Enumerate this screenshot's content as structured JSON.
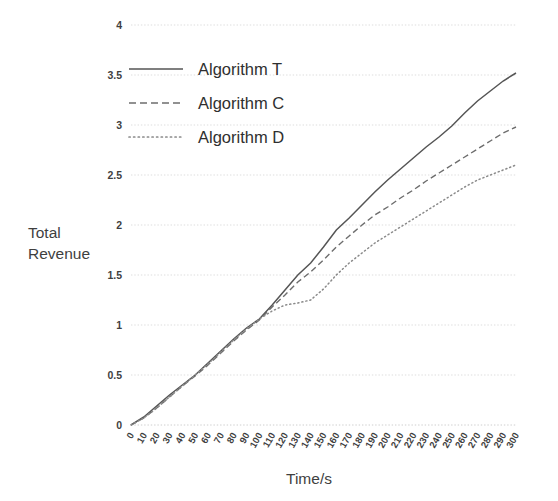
{
  "chart_data": {
    "type": "line",
    "title": "",
    "xlabel": "Time/s",
    "ylabel": "Total Revenue",
    "xlim": [
      0,
      300
    ],
    "ylim": [
      0,
      4
    ],
    "grid": true,
    "legend_position": "upper-left",
    "x": [
      0,
      10,
      20,
      30,
      40,
      50,
      60,
      70,
      80,
      90,
      100,
      110,
      120,
      130,
      140,
      150,
      160,
      170,
      180,
      190,
      200,
      210,
      220,
      230,
      240,
      250,
      260,
      270,
      280,
      290,
      300
    ],
    "xticks": [
      "0",
      "10",
      "20",
      "30",
      "40",
      "50",
      "60",
      "70",
      "80",
      "90",
      "100",
      "110",
      "120",
      "130",
      "140",
      "150",
      "160",
      "170",
      "180",
      "190",
      "200",
      "210",
      "220",
      "230",
      "240",
      "250",
      "260",
      "270",
      "280",
      "290",
      "300"
    ],
    "yticks": [
      "0",
      "0.5",
      "1",
      "1.5",
      "2",
      "2.5",
      "3",
      "3.5",
      "4"
    ],
    "ytick_values": [
      0,
      0.5,
      1,
      1.5,
      2,
      2.5,
      3,
      3.5,
      4
    ],
    "series": [
      {
        "name": "Algorithm T",
        "style": "solid",
        "color": "#555555",
        "values": [
          0.0,
          0.08,
          0.19,
          0.3,
          0.4,
          0.5,
          0.62,
          0.74,
          0.86,
          0.97,
          1.06,
          1.2,
          1.35,
          1.5,
          1.62,
          1.78,
          1.95,
          2.07,
          2.2,
          2.33,
          2.45,
          2.56,
          2.67,
          2.78,
          2.88,
          2.99,
          3.12,
          3.24,
          3.34,
          3.44,
          3.52
        ]
      },
      {
        "name": "Algorithm C",
        "style": "dashed",
        "color": "#6d6d6d",
        "values": [
          0.0,
          0.07,
          0.17,
          0.28,
          0.39,
          0.49,
          0.6,
          0.72,
          0.84,
          0.95,
          1.05,
          1.18,
          1.3,
          1.43,
          1.53,
          1.65,
          1.78,
          1.89,
          2.0,
          2.1,
          2.18,
          2.27,
          2.35,
          2.44,
          2.52,
          2.6,
          2.68,
          2.76,
          2.84,
          2.92,
          2.98
        ]
      },
      {
        "name": "Algorithm D",
        "style": "dotted",
        "color": "#8a8a8a",
        "values": [
          0.0,
          0.07,
          0.17,
          0.28,
          0.39,
          0.5,
          0.61,
          0.73,
          0.85,
          0.96,
          1.06,
          1.14,
          1.2,
          1.22,
          1.25,
          1.36,
          1.5,
          1.62,
          1.72,
          1.82,
          1.9,
          1.98,
          2.06,
          2.14,
          2.22,
          2.3,
          2.38,
          2.45,
          2.5,
          2.55,
          2.6
        ]
      }
    ]
  },
  "legend": {
    "items": [
      {
        "label": "Algorithm T",
        "style": "solid"
      },
      {
        "label": "Algorithm C",
        "style": "dashed"
      },
      {
        "label": "Algorithm D",
        "style": "dotted"
      }
    ]
  }
}
